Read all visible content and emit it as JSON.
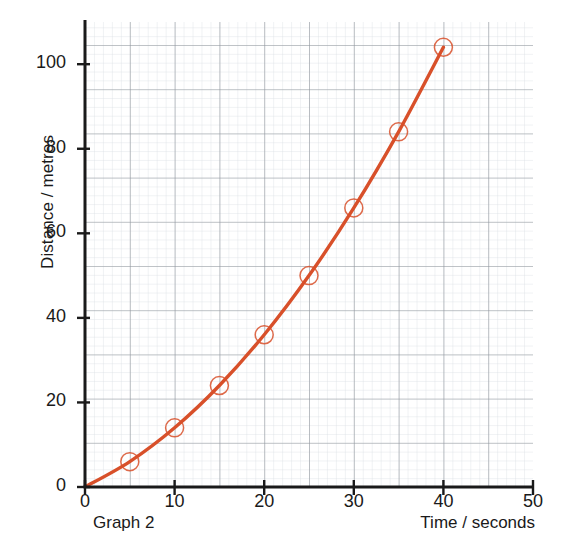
{
  "chart_data": {
    "type": "line",
    "title": "",
    "caption": "Graph 2",
    "xlabel": "Time / seconds",
    "ylabel": "Distance / metres",
    "xlim": [
      0,
      50
    ],
    "ylim": [
      0,
      105
    ],
    "x_ticks": [
      0,
      10,
      20,
      30,
      40,
      50
    ],
    "x_tick_labels": [
      "0",
      "10",
      "20",
      "30",
      "40",
      "50"
    ],
    "y_ticks": [
      0,
      20,
      40,
      60,
      80,
      100
    ],
    "y_tick_labels": [
      "0",
      "20",
      "40",
      "60",
      "80",
      "100"
    ],
    "grid": true,
    "grid_major_step_x": 5,
    "grid_major_step_y": 10,
    "grid_minor_step_x": 1,
    "grid_minor_step_y": 2,
    "legend": null,
    "marker": "open-circle",
    "series": [
      {
        "name": "Distance vs time",
        "color": "#d8502a",
        "x": [
          0,
          5,
          10,
          15,
          20,
          25,
          30,
          35,
          40
        ],
        "y": [
          0,
          6,
          14,
          24,
          36,
          50,
          66,
          84,
          104
        ],
        "markers_shown_at": [
          5,
          10,
          15,
          20,
          25,
          30,
          35,
          40
        ]
      }
    ]
  },
  "colors": {
    "series": "#d8502a",
    "axis": "#1a1a1a",
    "grid_major": "#8a8f96",
    "grid_minor": "#cdd2d8",
    "background": "#ffffff",
    "text": "#1a1a1a"
  },
  "axis": {
    "y_title": "Distance / metres",
    "x_title": "Time / seconds",
    "graph_caption": "Graph 2"
  },
  "y_labels": [
    "100",
    "80",
    "60",
    "40",
    "20",
    "0"
  ],
  "x_labels": [
    "0",
    "10",
    "20",
    "30",
    "40",
    "50"
  ]
}
